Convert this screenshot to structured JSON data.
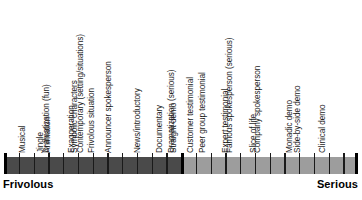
{
  "chart_data": {
    "type": "bar",
    "title": "",
    "subtitle": "",
    "xlabel": "",
    "ylabel": "",
    "orientation": "horizontal-scale",
    "axis_anchors": {
      "left": "Frivolous",
      "right": "Serious"
    },
    "legend": [],
    "grid": false,
    "categories": [
      "Comedy/fun",
      "Famous spokesperson (fun)",
      "Musical",
      "Jingle",
      "Animation",
      "Dramatization (fun)",
      "Exaggeration",
      "Symbolic characters",
      "Frivolous situation",
      "Contemporary (setting/situations)",
      "Announcer spokesperson",
      "News/introductory",
      "Documentary",
      "Straight demo",
      "Dramatization (serious)",
      "Customer testimonial",
      "Peer group testimonial",
      "Expert testimonial",
      "Slice of life",
      "Famous spokesperson (serious)",
      "Company spokesperson",
      "Monadic demo",
      "Side-by-side demo",
      "Clinical demo"
    ],
    "values": [
      1,
      2,
      3,
      4,
      5,
      6,
      7,
      8,
      9,
      10,
      11,
      12,
      13,
      14,
      15,
      16,
      17,
      18,
      19,
      20,
      21,
      22,
      23,
      24
    ],
    "xlim": [
      0,
      24
    ],
    "segments": [
      {
        "name": "Frivolous",
        "color": "#4a4a4a",
        "start_index": 0,
        "end_index": 12
      },
      {
        "name": "Serious",
        "color": "#9d9d9d",
        "start_index": 12,
        "end_index": 24
      }
    ]
  },
  "scale": {
    "anchor_left": "Frivolous",
    "anchor_right": "Serious",
    "colors": {
      "frivolous_fill": "#4a4a4a",
      "serious_fill": "#9d9d9d",
      "tick": "#1a1a1a",
      "text": "#1c1c1c"
    },
    "items": [
      {
        "label": "Comedy/fun"
      },
      {
        "label": "Famous spokesperson (fun)"
      },
      {
        "label": "Musical"
      },
      {
        "label": "Jingle"
      },
      {
        "label": "Animation"
      },
      {
        "label": "Dramatization (fun)"
      },
      {
        "label": "Exaggeration"
      },
      {
        "label": "Symbolic characters"
      },
      {
        "label": "Frivolous situation"
      },
      {
        "label": "Contemporary (setting/situations)"
      },
      {
        "label": "Announcer spokesperson"
      },
      {
        "label": "News/introductory"
      },
      {
        "label": "Documentary"
      },
      {
        "label": "Straight demo"
      },
      {
        "label": "Dramatization (serious)"
      },
      {
        "label": "Customer testimonial"
      },
      {
        "label": "Peer group testimonial"
      },
      {
        "label": "Expert testimonial"
      },
      {
        "label": "Slice of life"
      },
      {
        "label": "Famous spokesperson (serious)"
      },
      {
        "label": "Company spokesperson"
      },
      {
        "label": "Monadic demo"
      },
      {
        "label": "Side-by-side demo"
      },
      {
        "label": "Clinical demo"
      }
    ]
  }
}
